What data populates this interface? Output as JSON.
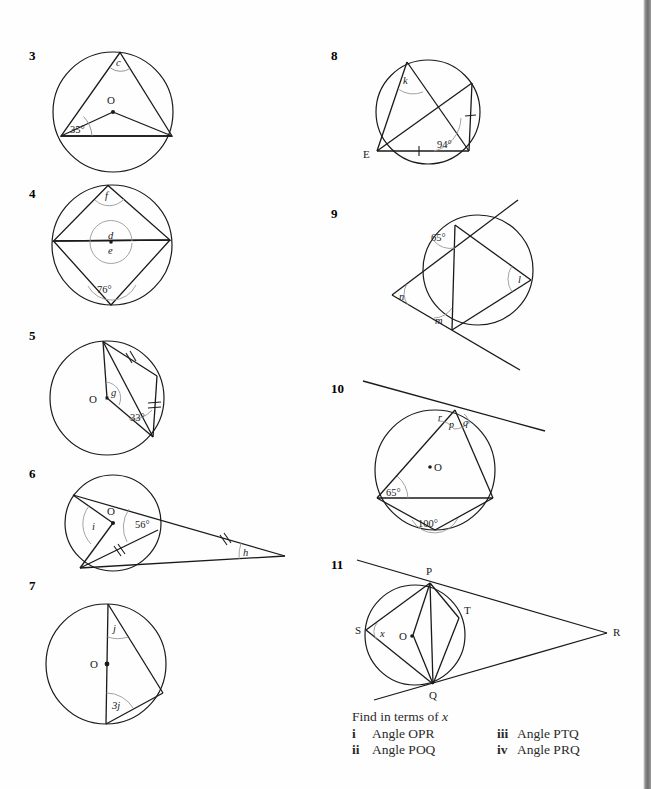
{
  "page": {
    "width": 651,
    "height": 789,
    "background": "#fefefe",
    "ink": "#1a1a1a"
  },
  "prompt": {
    "heading_text": "Find in terms of ",
    "heading_var": "x",
    "items": [
      {
        "numeral": "i",
        "label": "Angle OPR"
      },
      {
        "numeral": "ii",
        "label": "Angle POQ"
      },
      {
        "numeral": "iii",
        "label": "Angle PTQ"
      },
      {
        "numeral": "iv",
        "label": "Angle PRQ"
      }
    ]
  },
  "figures": [
    {
      "number": "3",
      "description": "Circle with centre O, inscribed triangle and two radii",
      "centre_label": "O",
      "labels": [
        "c",
        "35°"
      ],
      "angle_labels": {
        "inscribed": "c",
        "central_base": "35°"
      }
    },
    {
      "number": "4",
      "description": "Circle with cyclic quadrilateral, angles f, d, e and 76 degrees",
      "labels": [
        "f",
        "d",
        "e",
        "76°"
      ]
    },
    {
      "number": "5",
      "description": "Circle centre O with two equal chords marked, angle g at centre and 33 degrees",
      "centre_label": "O",
      "labels": [
        "g",
        "33°"
      ]
    },
    {
      "number": "6",
      "description": "Circle centre O with external point, angles i, 56 degrees and h",
      "centre_label": "O",
      "labels": [
        "i",
        "56°",
        "h"
      ]
    },
    {
      "number": "7",
      "description": "Circle centre O with diameter, inscribed angles j and 3j",
      "centre_label": "O",
      "labels": [
        "j",
        "3j"
      ]
    },
    {
      "number": "8",
      "description": "Circle with point E, equal chords marked, angles k and 94 degrees",
      "point_labels": [
        "E"
      ],
      "labels": [
        "k",
        "94°"
      ]
    },
    {
      "number": "9",
      "description": "Two tangents from external point, angles n, 65 degrees, m and l",
      "labels": [
        "65°",
        "n",
        "m",
        "l"
      ]
    },
    {
      "number": "10",
      "description": "Circle centre O with tangent, angles r, p, q, 65 degrees and 100 degrees",
      "centre_label": "O",
      "labels": [
        "r",
        "p",
        "q",
        "65°",
        "100°"
      ]
    },
    {
      "number": "11",
      "description": "Circle centre O with tangents from R touching at P and Q, points S and T, angle x at S",
      "centre_label": "O",
      "point_labels": [
        "P",
        "Q",
        "R",
        "S",
        "T"
      ],
      "labels": [
        "x"
      ]
    }
  ]
}
